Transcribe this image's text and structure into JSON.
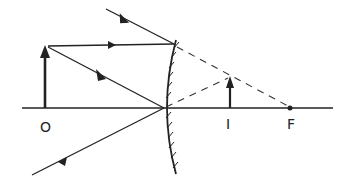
{
  "diagram": {
    "labels": {
      "object": "O",
      "image": "I",
      "focus": "F"
    },
    "colors": {
      "ink": "#222222",
      "background": "#ffffff"
    },
    "elements": {
      "principal_axis": "horizontal line",
      "mirror": "convex mirror with hatched back",
      "object_arrow": "upright arrow at O",
      "image_arrow": "upright, virtual, diminished arrow at I",
      "rays": [
        "ray parallel to axis reflected away, appearing to come from F (dashed extension to F)",
        "ray toward pole reflected symmetrically (dashed extension to image tip)"
      ]
    }
  }
}
